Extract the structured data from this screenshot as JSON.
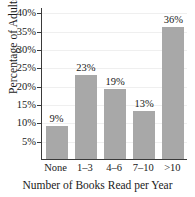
{
  "chart_data": {
    "type": "bar",
    "title": "",
    "xlabel": "Number of Books Read per Year",
    "ylabel": "Percentage of Adults",
    "categories": [
      "None",
      "1–3",
      "4–6",
      "7–10",
      ">10"
    ],
    "values": [
      9,
      23,
      19,
      13,
      36
    ],
    "value_labels": [
      "9%",
      "23%",
      "19%",
      "13%",
      "36%"
    ],
    "ytick_values": [
      5,
      10,
      15,
      20,
      25,
      30,
      35,
      40
    ],
    "ytick_labels": [
      "5%",
      "10%",
      "15%",
      "20%",
      "25%",
      "30%",
      "35%",
      "40%"
    ],
    "ylim": [
      0,
      41.5
    ],
    "grid": true,
    "legend": false,
    "bar_color": "#a8a8a8",
    "gridline_color": "#efefef",
    "axis_color": "#3a3a3a",
    "text_color": "#1a1a1a"
  }
}
